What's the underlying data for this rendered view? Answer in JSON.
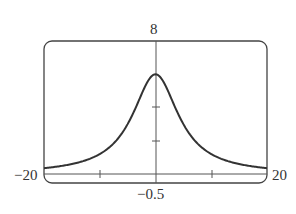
{
  "chart_data": {
    "type": "line",
    "title": "",
    "xlabel": "",
    "ylabel": "",
    "xlim": [
      -20,
      20
    ],
    "ylim": [
      -0.5,
      8
    ],
    "x_tick_labels": {
      "left": "−20",
      "right": "20"
    },
    "y_tick_labels": {
      "top": "8",
      "bottom": "−0.5"
    },
    "x_ticks": [
      -10,
      0,
      10
    ],
    "y_ticks": [
      2,
      4
    ],
    "grid": false,
    "legend": null,
    "series": [
      {
        "name": "f(x)",
        "x": [
          -20,
          -15,
          -10,
          -7.5,
          -5,
          -2.5,
          0,
          2.5,
          5,
          7.5,
          10,
          15,
          20
        ],
        "values": [
          0.35,
          0.59,
          1.2,
          1.87,
          2.94,
          4.7,
          6.0,
          4.7,
          2.94,
          1.87,
          1.2,
          0.59,
          0.35
        ]
      }
    ]
  }
}
